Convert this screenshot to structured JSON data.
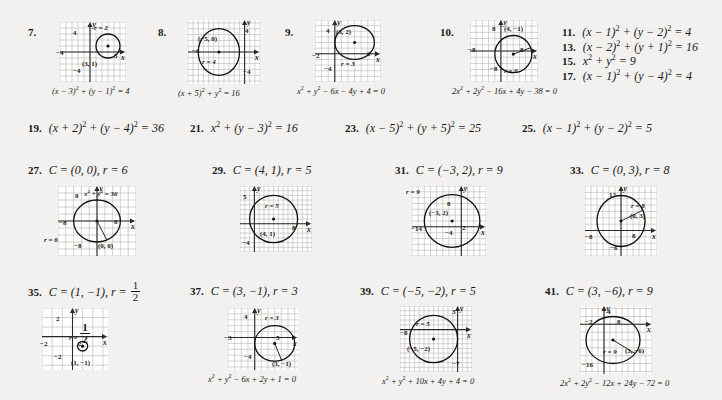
{
  "page": {
    "background": "#f2f1ef",
    "ink": "#1a1a1a",
    "grid_color": "#b9b6b2",
    "axis_color": "#2a2a2a"
  },
  "row1": [
    {
      "number": "7.",
      "caption": "(x &minus; 3)<sup>2</sup> + (y &minus; 1)<sup>2</sup> = 4",
      "graph": {
        "center": [
          3,
          1
        ],
        "radius": 2,
        "center_label": "(3, 1)",
        "radius_label": "r = 2",
        "x_ticks": [
          "&minus;4",
          "5"
        ],
        "y_ticks": [
          "4",
          "&minus;4"
        ],
        "xaxis_name": "x",
        "yaxis_name": "y",
        "xlim": [
          -5,
          6
        ],
        "ylim": [
          -5,
          5
        ]
      }
    },
    {
      "number": "8.",
      "caption": "(x + 5)<sup>2</sup> + y<sup>2</sup> = 16",
      "graph": {
        "center": [
          -5,
          0
        ],
        "radius": 4,
        "center_label": "(&minus;5, 0)",
        "radius_label": "r = 4",
        "x_ticks": [
          "&minus;6"
        ],
        "y_ticks": [
          "4",
          "&minus;4"
        ],
        "xaxis_name": "x",
        "yaxis_name": "y",
        "xlim": [
          -11,
          3
        ],
        "ylim": [
          -5.5,
          5.5
        ]
      }
    },
    {
      "number": "9.",
      "caption": "x<sup>2</sup> + y<sup>2</sup> &minus; 6x &minus; 4y + 4 = 0",
      "graph": {
        "center": [
          3,
          2
        ],
        "radius": 3,
        "center_label": "(3, 2)",
        "radius_label": "r = 3",
        "x_ticks": [
          "&minus;2",
          "6"
        ],
        "y_ticks": [
          "4",
          "&minus;4"
        ],
        "xaxis_name": "x",
        "yaxis_name": "y",
        "xlim": [
          -3,
          7
        ],
        "ylim": [
          -5,
          6
        ]
      }
    },
    {
      "number": "10.",
      "caption": "2x<sup>2</sup> + 2y<sup>2</sup> &minus; 16x + 4y &minus; 38 = 0",
      "graph": {
        "center": [
          4,
          -1
        ],
        "radius": 6,
        "center_label": "(4, &minus;1)",
        "radius_label": "r = 6",
        "x_ticks": [
          "&minus;8",
          "8"
        ],
        "y_ticks": [
          "8",
          "&minus;8"
        ],
        "xaxis_name": "x",
        "yaxis_name": "y",
        "xlim": [
          -10,
          12
        ],
        "ylim": [
          -10,
          10
        ]
      }
    }
  ],
  "list_right": [
    {
      "number": "11.",
      "text": "(x &minus; 1)<sup>2</sup> + (y &minus; 2)<sup>2</sup> = 4"
    },
    {
      "number": "13.",
      "text": "(x &minus; 2)<sup>2</sup> + (y + 1)<sup>2</sup> = 16"
    },
    {
      "number": "15.",
      "text": "x<sup>2</sup> + y<sup>2</sup> = 9"
    },
    {
      "number": "17.",
      "text": "(x &minus; 1)<sup>2</sup> + (y &minus; 4)<sup>2</sup> = 4"
    }
  ],
  "row2": [
    {
      "number": "19.",
      "text": "(x + 2)<sup>2</sup> + (y &minus; 4)<sup>2</sup> = 36"
    },
    {
      "number": "21.",
      "text": "x<sup>2</sup> + (y &minus; 3)<sup>2</sup> = 16"
    },
    {
      "number": "23.",
      "text": "(x &minus; 5)<sup>2</sup> + (y + 5)<sup>2</sup> = 25"
    },
    {
      "number": "25.",
      "text": "(x &minus; 1)<sup>2</sup> + (y &minus; 2)<sup>2</sup> = 5"
    }
  ],
  "row3": [
    {
      "number": "27.",
      "heading": "C = (0, 0), r = 6",
      "caption": "",
      "graph": {
        "center": [
          0,
          0
        ],
        "radius": 6,
        "center_label": "(0, 0)",
        "radius_label": "r = 6",
        "equation_label": "x<sup>2</sup> + y<sup>2</sup> = 36",
        "x_ticks": [
          "&minus;8",
          "8"
        ],
        "y_ticks": [
          "8",
          "&minus;8"
        ],
        "xaxis_name": "x",
        "yaxis_name": "y",
        "xlim": [
          -10,
          10
        ],
        "ylim": [
          -10,
          10
        ]
      }
    },
    {
      "number": "29.",
      "heading": "C = (4, 1), r = 5",
      "caption": "",
      "graph": {
        "center": [
          4,
          1
        ],
        "radius": 5,
        "center_label": "(4, 1)",
        "radius_label": "r = 5",
        "x_ticks": [
          "8"
        ],
        "y_ticks": [
          "5",
          "&minus;4"
        ],
        "xaxis_name": "x",
        "yaxis_name": "y",
        "xlim": [
          -3,
          12
        ],
        "ylim": [
          -6,
          8
        ]
      }
    },
    {
      "number": "31.",
      "heading": "C = (&minus;3, 2), r = 9",
      "caption": "",
      "graph": {
        "center": [
          -3,
          2
        ],
        "radius": 9,
        "center_label": "(&minus;3, 2)",
        "radius_label": "r = 9",
        "x_ticks": [
          "&minus;14",
          "2"
        ],
        "y_ticks": [
          "8",
          "&minus;4"
        ],
        "xaxis_name": "x",
        "yaxis_name": "y",
        "xlim": [
          -16,
          8
        ],
        "ylim": [
          -10,
          14
        ]
      }
    },
    {
      "number": "33.",
      "heading": "C = (0, 3), r = 8",
      "caption": "",
      "graph": {
        "center": [
          0,
          3
        ],
        "radius": 8,
        "center_label": "(0, 3)",
        "radius_label": "r = 8",
        "x_ticks": [
          "&minus;8",
          "8"
        ],
        "y_ticks": [
          "12",
          "&minus;6"
        ],
        "xaxis_name": "x",
        "yaxis_name": "y",
        "xlim": [
          -12,
          12
        ],
        "ylim": [
          -8,
          14
        ]
      }
    }
  ],
  "row4": [
    {
      "number": "35.",
      "heading_pre": "C = (1, &minus;1), r = ",
      "heading_frac": {
        "top": "1",
        "bottom": "2"
      },
      "caption": "",
      "graph": {
        "center": [
          1,
          -1
        ],
        "radius": 0.5,
        "center_label": "(1, &minus;1)",
        "radius_label_frac": {
          "pre": "r = ",
          "top": "1",
          "bottom": "2"
        },
        "x_ticks": [
          "&minus;2",
          "2"
        ],
        "y_ticks": [
          "2",
          "&minus;2"
        ],
        "xaxis_name": "x",
        "yaxis_name": "y",
        "xlim": [
          -3,
          3.5
        ],
        "ylim": [
          -3.5,
          3
        ]
      }
    },
    {
      "number": "37.",
      "heading": "C = (3, &minus;1), r = 3",
      "caption": "x<sup>2</sup> + y<sup>2</sup> &minus; 6x + 2y + 1 = 0",
      "graph": {
        "center": [
          3,
          -1
        ],
        "radius": 3,
        "center_label": "(3, &minus;1)",
        "radius_label": "r = 3",
        "x_ticks": [
          "&minus;3",
          "5"
        ],
        "y_ticks": [
          "4",
          "&minus;4"
        ],
        "xaxis_name": "x",
        "yaxis_name": "y",
        "xlim": [
          -4,
          6.5
        ],
        "ylim": [
          -5.5,
          5
        ]
      }
    },
    {
      "number": "39.",
      "heading": "C = (&minus;5, &minus;2), r = 5",
      "caption": "x<sup>2</sup> + y<sup>2</sup> + 10x + 4y + 4 = 0",
      "graph": {
        "center": [
          -5,
          -2
        ],
        "radius": 5,
        "center_label": "(&minus;5, &minus;2)",
        "radius_label": "r = 5",
        "x_ticks": [
          "&minus;8"
        ],
        "y_ticks": [
          "3",
          "&minus;7"
        ],
        "xaxis_name": "x",
        "yaxis_name": "y",
        "xlim": [
          -12,
          3
        ],
        "ylim": [
          -9,
          5
        ]
      }
    },
    {
      "number": "41.",
      "heading": "C = (3, &minus;6), r = 9",
      "caption": "2x<sup>2</sup> + 2y<sup>2</sup> &minus; 12x + 24y &minus; 72 = 0",
      "graph": {
        "center": [
          3,
          -6
        ],
        "radius": 9,
        "center_label": "(3, &minus;6)",
        "radius_label": "r = 9",
        "x_ticks": [
          "&minus;2",
          "8"
        ],
        "y_ticks": [
          "4",
          "&minus;16"
        ],
        "xaxis_name": "x",
        "yaxis_name": "y",
        "xlim": [
          -8,
          16
        ],
        "ylim": [
          -19,
          7
        ]
      }
    }
  ]
}
